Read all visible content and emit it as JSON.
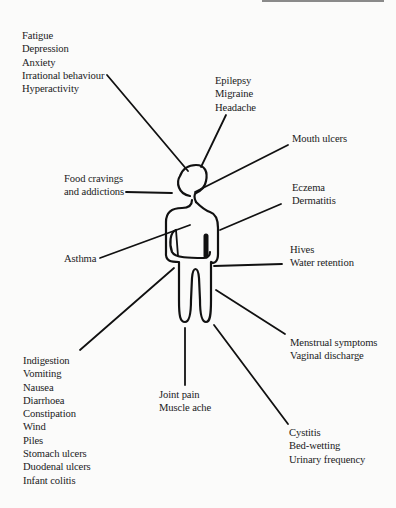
{
  "diagram": {
    "type": "body-symptom-map",
    "figure": "stylized human outline with pointer lines to symptom groups",
    "groups": [
      {
        "id": "mental",
        "lines": [
          "Fatigue",
          "Depression",
          "Anxiety",
          "Irrational behaviour",
          "Hyperactivity"
        ]
      },
      {
        "id": "head",
        "lines": [
          "Epilepsy",
          "Migraine",
          "Headache"
        ]
      },
      {
        "id": "mouth",
        "lines": [
          "Mouth ulcers"
        ]
      },
      {
        "id": "cravings",
        "lines": [
          "Food cravings",
          "and addictions"
        ]
      },
      {
        "id": "skin",
        "lines": [
          "Eczema",
          "Dermatitis"
        ]
      },
      {
        "id": "lungs",
        "lines": [
          "Asthma"
        ]
      },
      {
        "id": "fluid",
        "lines": [
          "Hives",
          "Water retention"
        ]
      },
      {
        "id": "reproductive",
        "lines": [
          "Menstrual symptoms",
          "Vaginal discharge"
        ]
      },
      {
        "id": "digestive",
        "lines": [
          "Indigestion",
          "Vomiting",
          "Nausea",
          "Diarrhoea",
          "Constipation",
          "Wind",
          "Piles",
          "Stomach ulcers",
          "Duodenal ulcers",
          "Infant colitis"
        ]
      },
      {
        "id": "musculoskeletal",
        "lines": [
          "Joint pain",
          "Muscle ache"
        ]
      },
      {
        "id": "urinary",
        "lines": [
          "Cystitis",
          "Bed-wetting",
          "Urinary frequency"
        ]
      }
    ]
  }
}
